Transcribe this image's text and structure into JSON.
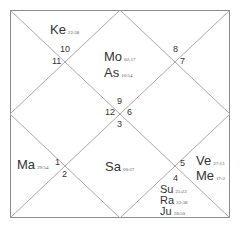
{
  "chart": {
    "type": "North Indian birth chart",
    "colors": {
      "line": "#a8a8a8",
      "border": "#8c8c8c",
      "text": "#333333"
    },
    "house_numbers": {
      "h9": "9",
      "h12": "12",
      "h6": "6",
      "h3": "3",
      "h10": "10",
      "h11": "11",
      "h8": "8",
      "h7": "7",
      "h1": "1",
      "h2": "2",
      "h5": "5",
      "h4": "4"
    },
    "planets": {
      "ke": {
        "name": "Ke",
        "degree": "22:38"
      },
      "mo": {
        "name": "Mo",
        "degree": "02:17"
      },
      "as": {
        "name": "As",
        "degree": "10:54"
      },
      "ma": {
        "name": "Ma",
        "degree": "29:54"
      },
      "sa": {
        "name": "Sa",
        "degree": "00:37"
      },
      "ve": {
        "name": "Ve",
        "degree": "27:13"
      },
      "me": {
        "name": "Me",
        "degree": "17:2"
      },
      "su": {
        "name": "Su",
        "degree": "25:22"
      },
      "ra": {
        "name": "Ra",
        "degree": "22:38"
      },
      "ju": {
        "name": "Ju",
        "degree": "18:50"
      }
    }
  }
}
